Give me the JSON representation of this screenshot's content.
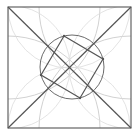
{
  "figure": {
    "canvas": {
      "width": 139,
      "height": 136
    },
    "colors": {
      "background": "#ffffff",
      "primary_stroke": "#555555",
      "circle_stroke": "#6b6b6b",
      "construction_stroke": "#c9c9c9",
      "construction_faint": "#dcdcdc"
    }
  },
  "geometry": {
    "outer_square": {
      "label": "outer-square",
      "x": 8,
      "y": 7,
      "width": 123,
      "height": 121,
      "corners": [
        {
          "name": "top-left",
          "x": 8,
          "y": 7
        },
        {
          "name": "top-right",
          "x": 131,
          "y": 7
        },
        {
          "name": "bottom-right",
          "x": 131,
          "y": 128
        },
        {
          "name": "bottom-left",
          "x": 8,
          "y": 128
        }
      ]
    },
    "diagonals": [
      {
        "name": "diagonal-tl-br",
        "x1": 8,
        "y1": 7,
        "x2": 131,
        "y2": 128
      },
      {
        "name": "diagonal-tr-bl",
        "x1": 131,
        "y1": 7,
        "x2": 8,
        "y2": 128
      }
    ],
    "main_circle": {
      "label": "central-circle",
      "cx": 72,
      "cy": 67,
      "r": 32
    },
    "inner_rhombus": {
      "label": "inscribed-rhombus",
      "vertices": [
        {
          "name": "top",
          "x": 64,
          "y": 36
        },
        {
          "name": "right",
          "x": 103,
          "y": 59
        },
        {
          "name": "bottom",
          "x": 80,
          "y": 98
        },
        {
          "name": "left",
          "x": 41,
          "y": 75
        }
      ],
      "points_path": "64,36 103,59 80,98 41,75"
    },
    "construction_arcs": [
      {
        "name": "arc-from-top-left-corner",
        "cx": 8,
        "cy": 7,
        "r": 92
      },
      {
        "name": "arc-from-top-right-corner",
        "cx": 131,
        "cy": 7,
        "r": 92
      },
      {
        "name": "arc-from-bottom-left-corner",
        "cx": 8,
        "cy": 128,
        "r": 92
      },
      {
        "name": "arc-from-bottom-right-corner",
        "cx": 131,
        "cy": 128,
        "r": 92
      },
      {
        "name": "arc-from-left-midpoint",
        "cx": 8,
        "cy": 67,
        "r": 62
      },
      {
        "name": "arc-from-right-midpoint",
        "cx": 131,
        "cy": 67,
        "r": 62
      },
      {
        "name": "arc-from-top-midpoint",
        "cx": 69,
        "cy": 7,
        "r": 61
      },
      {
        "name": "arc-from-bottom-midpoint",
        "cx": 69,
        "cy": 128,
        "r": 61
      }
    ],
    "vertex_markers": [
      {
        "name": "rhombus-vertex-top",
        "x": 64,
        "y": 36
      },
      {
        "name": "rhombus-vertex-right",
        "x": 103,
        "y": 59
      },
      {
        "name": "rhombus-vertex-bottom",
        "x": 80,
        "y": 98
      },
      {
        "name": "rhombus-vertex-left",
        "x": 41,
        "y": 75
      }
    ]
  }
}
